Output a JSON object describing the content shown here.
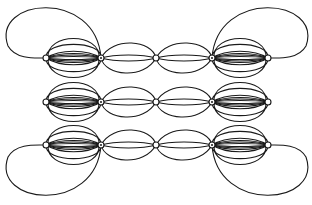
{
  "diagram": {
    "type": "graph-drawing",
    "stroke_color": "#1a1a1a",
    "background_color": "#ffffff",
    "rows": [
      {
        "id": "row-top",
        "y": 58,
        "nodes": [
          46,
          101,
          156,
          212,
          268
        ],
        "outer_loops": [
          "top-left",
          "top-right"
        ]
      },
      {
        "id": "row-middle",
        "y": 102,
        "nodes": [
          46,
          101,
          156,
          212,
          268
        ],
        "outer_loops": []
      },
      {
        "id": "row-bottom",
        "y": 145,
        "nodes": [
          46,
          101,
          156,
          212,
          268
        ],
        "outer_loops": [
          "bottom-left",
          "bottom-right"
        ]
      }
    ]
  }
}
